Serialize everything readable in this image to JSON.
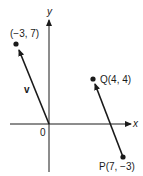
{
  "diagram": {
    "type": "vector-plane",
    "axes": {
      "x_label": "x",
      "y_label": "y",
      "origin_label": "0"
    },
    "points": [
      {
        "id": "A",
        "label": "(−3, 7)",
        "coords": [
          -3,
          7
        ]
      },
      {
        "id": "Q",
        "label": "Q(4, 4)",
        "coords": [
          4,
          4
        ]
      },
      {
        "id": "P",
        "label": "P(7, −3)",
        "coords": [
          7,
          -3
        ]
      }
    ],
    "vectors": [
      {
        "label": "v",
        "from": [
          0,
          0
        ],
        "to": [
          -3,
          7
        ]
      },
      {
        "label": "",
        "from": [
          7,
          -3
        ],
        "to": [
          4,
          4
        ]
      }
    ],
    "colors": {
      "ink": "#1a1a1a",
      "background": "#ffffff"
    }
  }
}
